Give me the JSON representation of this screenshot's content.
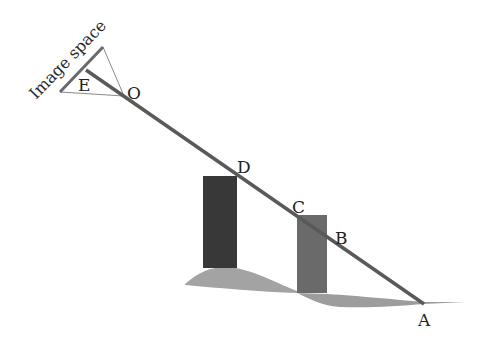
{
  "diagram": {
    "title_label": "Image space",
    "points": {
      "A": "A",
      "B": "B",
      "C": "C",
      "D": "D",
      "E": "E",
      "O": "O"
    },
    "colors": {
      "ray": "#555555",
      "image_plane": "#666666",
      "frustum": "#999999",
      "tall_bar": "#333333",
      "short_bar": "#666666",
      "ground": "#999999",
      "text": "#222222"
    }
  }
}
